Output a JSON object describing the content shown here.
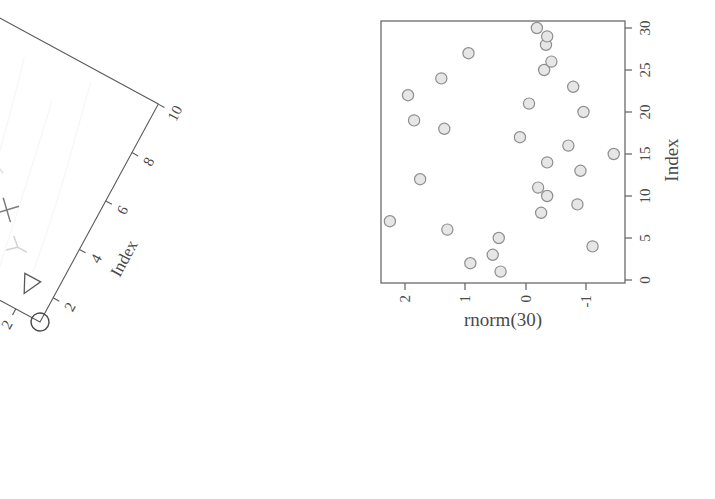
{
  "page": {
    "background": "#ffffff",
    "width": 715,
    "height": 499
  },
  "left_plot": {
    "name": "rotated-index-plot",
    "rotation_deg": -61.5,
    "ink_color": "#555555",
    "axis_color": "#555555",
    "xlabel": "Index",
    "ylabel": "1:10",
    "x_ticks": [
      "2",
      "4",
      "6",
      "8",
      "10"
    ],
    "y_ticks": [
      "2",
      "4",
      "6",
      "8",
      "10"
    ],
    "chart_data": {
      "type": "scatter",
      "title": "",
      "xlabel": "Index",
      "ylabel": "1:10",
      "xlim": [
        1,
        10
      ],
      "ylim": [
        1,
        10
      ],
      "grid": false,
      "legend": "none",
      "x_ticks": [
        2,
        4,
        6,
        8,
        10
      ],
      "y_ticks": [
        2,
        4,
        6,
        8,
        10
      ],
      "x": [
        1,
        2,
        3,
        4,
        5,
        6,
        7,
        8,
        9,
        10
      ],
      "y": [
        1,
        2,
        3,
        4,
        5,
        6,
        7,
        8,
        9,
        10
      ],
      "point_symbols": [
        "circle",
        "triangle-left",
        "y-shape",
        "x-cross",
        "triangle-right-faint",
        "triangle-right",
        "asterisk-faint",
        "faint-mark",
        "square-x",
        "circle-cross"
      ],
      "notes": "Points lie on the 1:1 diagonal; symbol varies per point (R pch sequence). Several symbols are very faint on the scan."
    }
  },
  "right_plot": {
    "name": "rnorm-index-plot",
    "ink_color": "#6b6b6b",
    "point_fill": "#e6e6e6",
    "point_stroke": "#8e8e8e",
    "xlabel": "rnorm(30)",
    "ylabel": "Index",
    "x_ticks": [
      "2",
      "1",
      "0",
      "-1"
    ],
    "y_ticks": [
      "0",
      "5",
      "10",
      "15",
      "20",
      "25",
      "30"
    ],
    "chart_data": {
      "type": "scatter",
      "title": "",
      "xlabel": "rnorm(30)",
      "ylabel": "Index",
      "xlim": [
        2.45,
        -1.55
      ],
      "ylim": [
        0,
        31
      ],
      "x_axis_reversed": true,
      "y_axis_side": "right",
      "grid": false,
      "legend": "none",
      "x_ticks": [
        2,
        1,
        0,
        -1
      ],
      "y_ticks": [
        0,
        5,
        10,
        15,
        20,
        25,
        30
      ],
      "index": [
        1,
        2,
        3,
        4,
        5,
        6,
        7,
        8,
        9,
        10,
        11,
        12,
        13,
        14,
        15,
        16,
        17,
        18,
        19,
        20,
        21,
        22,
        23,
        24,
        25,
        26,
        27,
        28,
        29,
        30
      ],
      "values": [
        0.42,
        0.92,
        0.55,
        -1.1,
        0.45,
        1.3,
        2.25,
        -0.25,
        -0.85,
        -0.35,
        -0.2,
        1.75,
        -0.9,
        -0.35,
        -1.45,
        -0.7,
        0.1,
        1.35,
        1.85,
        -0.95,
        -0.05,
        1.95,
        -0.78,
        1.4,
        -0.3,
        -0.42,
        0.95,
        -0.33,
        -0.35,
        -0.18
      ]
    }
  }
}
